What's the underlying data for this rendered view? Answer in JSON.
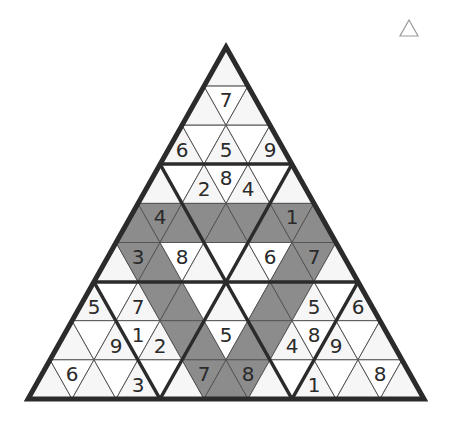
{
  "puzzle": {
    "type": "triangular-sudoku",
    "rows": 9,
    "geometry": {
      "apex_x": 226,
      "apex_y": 47,
      "row_height": 39.1,
      "half_base": 22
    },
    "colors": {
      "background": "#ffffff",
      "up_fill": "#f6f6f6",
      "down_fill": "#ffffff",
      "shaded_fill": "#8c8c8c",
      "thin_line": "#555555",
      "thick_line": "#2b2b2b",
      "digit": "#2a2a2a",
      "icon_stroke": "#9a9a9a"
    },
    "shaded_cells": [
      [
        4,
        0
      ],
      [
        4,
        1
      ],
      [
        4,
        2
      ],
      [
        4,
        3
      ],
      [
        4,
        4
      ],
      [
        4,
        5
      ],
      [
        4,
        6
      ],
      [
        4,
        7
      ],
      [
        4,
        8
      ],
      [
        5,
        1
      ],
      [
        5,
        2
      ],
      [
        5,
        8
      ],
      [
        5,
        9
      ],
      [
        6,
        3
      ],
      [
        6,
        4
      ],
      [
        6,
        8
      ],
      [
        6,
        9
      ],
      [
        7,
        5
      ],
      [
        7,
        6
      ],
      [
        7,
        8
      ],
      [
        7,
        9
      ],
      [
        8,
        7
      ],
      [
        8,
        8
      ],
      [
        8,
        9
      ]
    ],
    "givens": [
      {
        "row": 1,
        "col": 1,
        "value": "7"
      },
      {
        "row": 2,
        "col": 0,
        "value": "6"
      },
      {
        "row": 2,
        "col": 2,
        "value": "5"
      },
      {
        "row": 2,
        "col": 4,
        "value": "9"
      },
      {
        "row": 3,
        "col": 2,
        "value": "2"
      },
      {
        "row": 3,
        "col": 3,
        "value": "8"
      },
      {
        "row": 3,
        "col": 4,
        "value": "4"
      },
      {
        "row": 4,
        "col": 1,
        "value": "4"
      },
      {
        "row": 4,
        "col": 7,
        "value": "1"
      },
      {
        "row": 5,
        "col": 1,
        "value": "3"
      },
      {
        "row": 5,
        "col": 3,
        "value": "8"
      },
      {
        "row": 5,
        "col": 7,
        "value": "6"
      },
      {
        "row": 5,
        "col": 9,
        "value": "7"
      },
      {
        "row": 6,
        "col": 0,
        "value": "5"
      },
      {
        "row": 6,
        "col": 2,
        "value": "7"
      },
      {
        "row": 6,
        "col": 10,
        "value": "5"
      },
      {
        "row": 6,
        "col": 12,
        "value": "6"
      },
      {
        "row": 7,
        "col": 2,
        "value": "9"
      },
      {
        "row": 7,
        "col": 3,
        "value": "1"
      },
      {
        "row": 7,
        "col": 4,
        "value": "2"
      },
      {
        "row": 7,
        "col": 7,
        "value": "5"
      },
      {
        "row": 7,
        "col": 10,
        "value": "4"
      },
      {
        "row": 7,
        "col": 11,
        "value": "8"
      },
      {
        "row": 7,
        "col": 12,
        "value": "9"
      },
      {
        "row": 8,
        "col": 1,
        "value": "6"
      },
      {
        "row": 8,
        "col": 4,
        "value": "3"
      },
      {
        "row": 8,
        "col": 7,
        "value": "7"
      },
      {
        "row": 8,
        "col": 9,
        "value": "8"
      },
      {
        "row": 8,
        "col": 12,
        "value": "1"
      },
      {
        "row": 8,
        "col": 15,
        "value": "8"
      }
    ],
    "thick_lines": [
      [
        [
          160,
          164
        ],
        [
          292,
          164
        ]
      ],
      [
        [
          94,
          282
        ],
        [
          358,
          282
        ]
      ],
      [
        [
          160,
          164
        ],
        [
          226,
          282
        ]
      ],
      [
        [
          292,
          164
        ],
        [
          226,
          282
        ]
      ],
      [
        [
          94,
          282
        ],
        [
          160,
          399
        ]
      ],
      [
        [
          226,
          282
        ],
        [
          160,
          399
        ]
      ],
      [
        [
          226,
          282
        ],
        [
          292,
          399
        ]
      ],
      [
        [
          358,
          282
        ],
        [
          292,
          399
        ]
      ]
    ]
  },
  "corner_icon": {
    "name": "triangle-outline-icon"
  }
}
